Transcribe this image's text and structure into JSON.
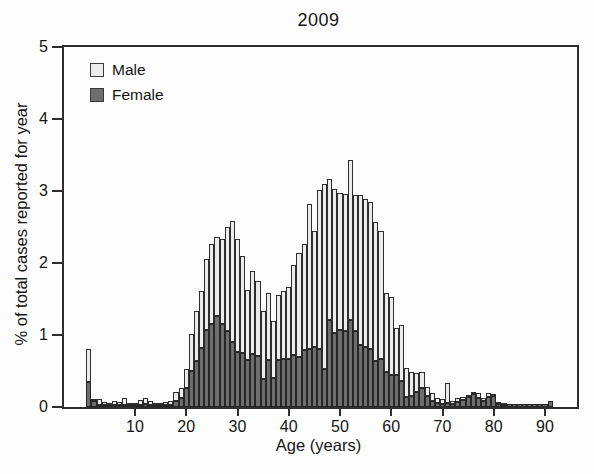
{
  "figure": {
    "title": "2009",
    "x_axis": {
      "label": "Age (years)",
      "ticks": [
        10,
        20,
        30,
        40,
        50,
        60,
        70,
        80,
        90
      ]
    },
    "y_axis": {
      "label": "% of total cases reported for year",
      "ticks": [
        0,
        1,
        2,
        3,
        4,
        5
      ]
    },
    "legend": [
      {
        "label": "Male",
        "color": "#ececec"
      },
      {
        "label": "Female",
        "color": "#6e6e6e"
      }
    ]
  },
  "chart_data": {
    "type": "bar",
    "stacked": true,
    "title": "2009",
    "xlabel": "Age (years)",
    "ylabel": "% of total cases reported for year",
    "xlim": [
      -4,
      97
    ],
    "ylim": [
      0,
      5
    ],
    "grid": false,
    "legend_position": "upper-left",
    "bin_width_years": 1,
    "age_start": 1,
    "age_end": 91,
    "stack_order": [
      "Female",
      "Male"
    ],
    "series": [
      {
        "name": "Female",
        "color": "#6e6e6e",
        "values": [
          0.35,
          0.09,
          0.02,
          0.01,
          0.01,
          0.02,
          0.01,
          0.03,
          0.01,
          0.01,
          0.03,
          0.04,
          0.03,
          0.02,
          0.01,
          0.02,
          0.03,
          0.09,
          0.13,
          0.26,
          0.5,
          0.64,
          0.82,
          1.07,
          1.16,
          1.26,
          1.16,
          1.05,
          0.9,
          0.77,
          0.75,
          0.65,
          0.73,
          0.71,
          0.39,
          0.65,
          0.4,
          0.65,
          0.67,
          0.67,
          0.72,
          0.7,
          0.79,
          0.81,
          0.83,
          0.81,
          0.53,
          1.21,
          1.03,
          1.07,
          1.05,
          1.21,
          1.05,
          0.86,
          0.84,
          0.81,
          0.64,
          0.67,
          0.48,
          0.44,
          0.44,
          0.36,
          0.14,
          0.16,
          0.21,
          0.27,
          0.16,
          0.09,
          0.05,
          0.04,
          0.05,
          0.04,
          0.07,
          0.1,
          0.14,
          0.18,
          0.12,
          0.09,
          0.14,
          0.15,
          0.04,
          0.03,
          0.04,
          0.04,
          0.04,
          0.04,
          0.04,
          0.04,
          0.04,
          0.04,
          0.08
        ]
      },
      {
        "name": "Male",
        "color": "#ececec",
        "values": [
          0.46,
          0.02,
          0.08,
          0.04,
          0.02,
          0.05,
          0.04,
          0.1,
          0.03,
          0.02,
          0.07,
          0.08,
          0.06,
          0.03,
          0.03,
          0.04,
          0.06,
          0.12,
          0.14,
          0.27,
          0.52,
          0.69,
          0.79,
          0.98,
          1.1,
          1.1,
          1.18,
          1.45,
          1.69,
          1.56,
          1.35,
          0.98,
          1.16,
          1.04,
          0.94,
          0.94,
          0.8,
          0.91,
          0.94,
          1.0,
          1.25,
          1.44,
          1.47,
          2.01,
          1.62,
          2.2,
          2.57,
          1.96,
          2.0,
          1.91,
          1.91,
          2.22,
          1.89,
          2.08,
          2.05,
          2.04,
          1.93,
          1.77,
          1.1,
          1.09,
          0.66,
          0.78,
          0.4,
          0.33,
          0.26,
          0.22,
          0.12,
          0.1,
          0.07,
          0.07,
          0.29,
          0.05,
          0.05,
          0.04,
          0.02,
          0.02,
          0.07,
          0.03,
          0.06,
          0.03,
          0.03,
          0.02,
          0.0,
          0.0,
          0.0,
          0.0,
          0.0,
          0.0,
          0.0,
          0.0,
          0.0
        ]
      }
    ]
  }
}
